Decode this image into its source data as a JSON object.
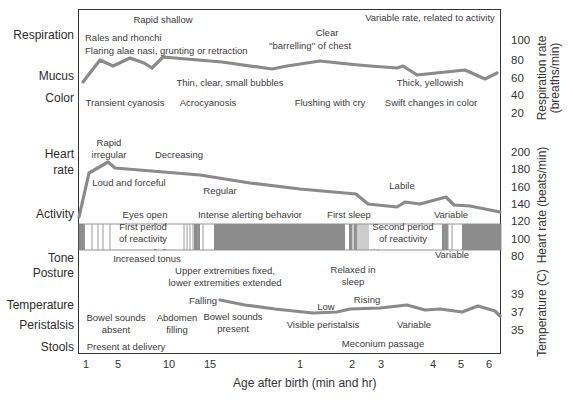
{
  "chart_data": {
    "type": "line",
    "title": "",
    "xlabel": "Age after birth (min and hr)",
    "x_ticks": [
      {
        "label": "1",
        "x": 86
      },
      {
        "label": "5",
        "x": 118
      },
      {
        "label": "10",
        "x": 169
      },
      {
        "label": "15",
        "x": 210
      },
      {
        "label": "1",
        "x": 300
      },
      {
        "label": "2",
        "x": 352
      },
      {
        "label": "3",
        "x": 381
      },
      {
        "label": "4",
        "x": 433
      },
      {
        "label": "5",
        "x": 461
      },
      {
        "label": "6",
        "x": 489
      }
    ],
    "row_labels": [
      {
        "label": "Respiration",
        "y": 36
      },
      {
        "label": "Mucus",
        "y": 77
      },
      {
        "label": "Color",
        "y": 99
      },
      {
        "label": "Heart",
        "y": 155
      },
      {
        "label": "rate",
        "y": 171
      },
      {
        "label": "Activity",
        "y": 215
      },
      {
        "label": "Tone",
        "y": 259
      },
      {
        "label": "Posture",
        "y": 274
      },
      {
        "label": "Temperature",
        "y": 306
      },
      {
        "label": "Peristalsis",
        "y": 326
      },
      {
        "label": "Stools",
        "y": 348
      }
    ],
    "right_axes": [
      {
        "label": "Respiration rate (breaths/min)",
        "ticks": [
          "100",
          "80",
          "60",
          "40",
          "20"
        ],
        "tick_y": [
          41,
          61,
          79,
          96,
          114
        ]
      },
      {
        "label": "Heart rate (beats/min)",
        "ticks": [
          "200",
          "180",
          "160",
          "140",
          "120",
          "100",
          "80"
        ],
        "tick_y": [
          153,
          170,
          188,
          205,
          222,
          240,
          257
        ]
      },
      {
        "label": "Temperature (C)",
        "ticks": [
          "39",
          "37",
          "35"
        ],
        "tick_y": [
          295,
          313,
          331
        ]
      }
    ],
    "series": [
      {
        "name": "Respiration rate",
        "unit": "breaths/min",
        "ylim": [
          20,
          100
        ],
        "points": [
          [
            83,
            82
          ],
          [
            100,
            60
          ],
          [
            113,
            66
          ],
          [
            130,
            58
          ],
          [
            144,
            63
          ],
          [
            152,
            68
          ],
          [
            163,
            57
          ],
          [
            222,
            62
          ],
          [
            272,
            69
          ],
          [
            287,
            66
          ],
          [
            320,
            61
          ],
          [
            348,
            64
          ],
          [
            370,
            66
          ],
          [
            397,
            68
          ],
          [
            403,
            66
          ],
          [
            417,
            75
          ],
          [
            465,
            70
          ],
          [
            485,
            79
          ],
          [
            497,
            73
          ]
        ]
      },
      {
        "name": "Heart rate",
        "unit": "beats/min",
        "ylim": [
          80,
          200
        ],
        "points": [
          [
            79,
            217
          ],
          [
            89,
            173
          ],
          [
            108,
            162
          ],
          [
            115,
            168
          ],
          [
            200,
            175
          ],
          [
            250,
            183
          ],
          [
            300,
            189
          ],
          [
            356,
            194
          ],
          [
            368,
            204
          ],
          [
            397,
            207
          ],
          [
            405,
            202
          ],
          [
            420,
            204
          ],
          [
            446,
            197
          ],
          [
            454,
            205
          ],
          [
            470,
            206
          ],
          [
            500,
            212
          ]
        ]
      },
      {
        "name": "Temperature",
        "unit": "C",
        "ylim": [
          35,
          39
        ],
        "points": [
          [
            220,
            300
          ],
          [
            245,
            305
          ],
          [
            275,
            309
          ],
          [
            313,
            313
          ],
          [
            337,
            312
          ],
          [
            350,
            309
          ],
          [
            380,
            308
          ],
          [
            407,
            305
          ],
          [
            425,
            310
          ],
          [
            440,
            309
          ],
          [
            462,
            312
          ],
          [
            478,
            306
          ],
          [
            495,
            311
          ],
          [
            500,
            316
          ]
        ]
      }
    ],
    "activity_bar": {
      "y": [
        224,
        250
      ],
      "dark_segments": [
        [
          79,
          85
        ],
        [
          154,
          157
        ],
        [
          163,
          166
        ],
        [
          194,
          200
        ],
        [
          214,
          345
        ],
        [
          349,
          352
        ],
        [
          354,
          357
        ],
        [
          442,
          448
        ],
        [
          462,
          501
        ]
      ],
      "thin_stripes": [
        84,
        92,
        98,
        103,
        110,
        184,
        187,
        190,
        193,
        198,
        203,
        352,
        354,
        356,
        358,
        360,
        362,
        364,
        366,
        368,
        371,
        374,
        378,
        445,
        448,
        452
      ],
      "labels": [
        "First period of reactivity",
        "Second period of reactivity"
      ]
    },
    "annotations": [
      {
        "text": "Rapid shallow",
        "x": 163,
        "y": 20
      },
      {
        "text": "Rales and rhonchi",
        "x": 125,
        "y": 38,
        "align": "left",
        "left": 85
      },
      {
        "text": "Flaring alae nasi, grunting or retraction",
        "x": 85,
        "y": 51,
        "align": "left",
        "left": 85
      },
      {
        "text": "Clear",
        "x": 327,
        "y": 33
      },
      {
        "text": "''barrelling'' of chest",
        "x": 310,
        "y": 46
      },
      {
        "text": "Variable rate, related to activity",
        "x": 430,
        "y": 18
      },
      {
        "text": "Thin, clear, small bubbles",
        "x": 230,
        "y": 83
      },
      {
        "text": "Thick, yellowish",
        "x": 430,
        "y": 83
      },
      {
        "text": "Transient cyanosis",
        "x": 125,
        "y": 103
      },
      {
        "text": "Acrocyanosis",
        "x": 208,
        "y": 103
      },
      {
        "text": "Flushing with cry",
        "x": 330,
        "y": 103
      },
      {
        "text": "Swift changes in color",
        "x": 431,
        "y": 103
      },
      {
        "text": "Rapid",
        "x": 109,
        "y": 143
      },
      {
        "text": "irregular",
        "x": 109,
        "y": 155
      },
      {
        "text": "Decreasing",
        "x": 179,
        "y": 155
      },
      {
        "text": "Loud and forceful",
        "x": 129,
        "y": 183
      },
      {
        "text": "Regular",
        "x": 220,
        "y": 191
      },
      {
        "text": "Labile",
        "x": 402,
        "y": 186
      },
      {
        "text": "Eyes open",
        "x": 145,
        "y": 215
      },
      {
        "text": "Intense alerting behavior",
        "x": 250,
        "y": 215
      },
      {
        "text": "First sleep",
        "x": 349,
        "y": 215
      },
      {
        "text": "Variable",
        "x": 451,
        "y": 215
      },
      {
        "text": "First period",
        "x": 143,
        "y": 227
      },
      {
        "text": "of reactivity",
        "x": 143,
        "y": 239
      },
      {
        "text": "Second period",
        "x": 403,
        "y": 227
      },
      {
        "text": "of reactivity",
        "x": 403,
        "y": 239
      },
      {
        "text": "Increased tonus",
        "x": 147,
        "y": 259
      },
      {
        "text": "Variable",
        "x": 452,
        "y": 255
      },
      {
        "text": "Upper extremities fixed,",
        "x": 225,
        "y": 271
      },
      {
        "text": "lower extremities extended",
        "x": 225,
        "y": 283
      },
      {
        "text": "Relaxed in",
        "x": 353,
        "y": 270
      },
      {
        "text": "sleep",
        "x": 353,
        "y": 282
      },
      {
        "text": "Falling",
        "x": 203,
        "y": 301
      },
      {
        "text": "Low",
        "x": 326,
        "y": 307
      },
      {
        "text": "Rising",
        "x": 367,
        "y": 300
      },
      {
        "text": "Bowel sounds",
        "x": 116,
        "y": 318
      },
      {
        "text": "absent",
        "x": 116,
        "y": 330
      },
      {
        "text": "Abdomen",
        "x": 177,
        "y": 318
      },
      {
        "text": "filling",
        "x": 177,
        "y": 330
      },
      {
        "text": "Bowel sounds",
        "x": 233,
        "y": 317
      },
      {
        "text": "present",
        "x": 233,
        "y": 329
      },
      {
        "text": "Visible peristalsis",
        "x": 323,
        "y": 325
      },
      {
        "text": "Variable",
        "x": 414,
        "y": 325
      },
      {
        "text": "Present at delivery",
        "x": 126,
        "y": 347
      },
      {
        "text": "Meconium passage",
        "x": 383,
        "y": 344
      }
    ],
    "colors": {
      "line": "#8a8a8a",
      "activity_dark": "#8c8c8c",
      "stripe": "#9a9a9a",
      "axis": "#333333"
    }
  }
}
